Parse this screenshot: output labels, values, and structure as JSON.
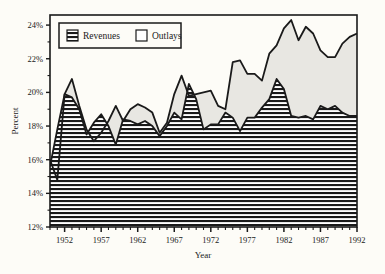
{
  "chart_data": {
    "type": "area",
    "title": "",
    "subtitle": "",
    "xlabel": "Year",
    "ylabel": "Percent",
    "xlim": [
      1950,
      1992
    ],
    "ylim": [
      12,
      24.6
    ],
    "ytick_values": [
      12,
      14,
      16,
      18,
      20,
      22,
      24
    ],
    "ytick_labels": [
      "12%",
      "14%",
      "16%",
      "18%",
      "20%",
      "22%",
      "24%"
    ],
    "y_minor_step": 1,
    "xtick_labels": [
      "1952",
      "1957",
      "1962",
      "1967",
      "1972",
      "1977",
      "1982",
      "1987",
      "1992"
    ],
    "xtick_values": [
      1952,
      1957,
      1962,
      1967,
      1972,
      1977,
      1982,
      1987,
      1992
    ],
    "x_minor_step": 1,
    "grid": false,
    "legend_position": "top-left",
    "legend": [
      {
        "name": "Revenues",
        "swatch": "hatched-horizontal"
      },
      {
        "name": "Outlays",
        "swatch": "white"
      }
    ],
    "x": [
      1950,
      1951,
      1952,
      1953,
      1954,
      1955,
      1956,
      1957,
      1958,
      1959,
      1960,
      1961,
      1962,
      1963,
      1964,
      1965,
      1966,
      1967,
      1968,
      1969,
      1970,
      1971,
      1972,
      1973,
      1974,
      1975,
      1976,
      1977,
      1978,
      1979,
      1980,
      1981,
      1982,
      1983,
      1984,
      1985,
      1986,
      1987,
      1988,
      1989,
      1990,
      1991,
      1992
    ],
    "series": [
      {
        "name": "Revenues",
        "values": [
          15.6,
          17.8,
          19.9,
          19.7,
          19.0,
          17.5,
          18.2,
          18.7,
          18.0,
          16.9,
          18.4,
          18.3,
          18.1,
          18.3,
          18.0,
          17.4,
          18.0,
          18.8,
          18.4,
          20.5,
          19.6,
          17.8,
          18.1,
          18.1,
          18.8,
          18.5,
          17.7,
          18.5,
          18.5,
          19.1,
          19.6,
          20.8,
          20.2,
          18.6,
          18.5,
          18.6,
          18.4,
          19.2,
          19.0,
          19.2,
          18.8,
          18.6,
          18.6
        ],
        "color": "#ffffff",
        "fill": "hatched-horizontal"
      },
      {
        "name": "Outlays",
        "values": [
          16.0,
          14.8,
          19.9,
          20.8,
          19.2,
          17.8,
          17.1,
          17.6,
          18.3,
          19.2,
          18.3,
          19.0,
          19.3,
          19.1,
          18.8,
          17.6,
          18.2,
          19.9,
          21.0,
          19.8,
          19.9,
          20.0,
          20.1,
          19.2,
          19.0,
          21.8,
          21.9,
          21.1,
          21.1,
          20.7,
          22.3,
          22.8,
          23.8,
          24.3,
          23.1,
          23.9,
          23.5,
          22.5,
          22.1,
          22.1,
          22.9,
          23.3,
          23.5
        ],
        "color": "#e8e7e2",
        "fill": "solid-light-gray"
      }
    ],
    "colors": {
      "outlays_fill": "#e8e7e2",
      "revenues_hatch_line": "#1a1a1a",
      "revenues_hatch_bg": "#ffffff",
      "line": "#1a1a1a",
      "frame": "#1a1a1a",
      "background": "#fdfcf7",
      "text": "#1a1a1a"
    }
  }
}
